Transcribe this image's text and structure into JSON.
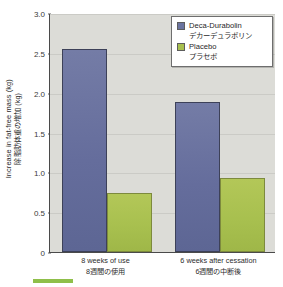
{
  "chart_data": {
    "type": "bar",
    "title": "",
    "subtitle": "",
    "xlabel": "",
    "ylabel": "Increase in fat-free mass (kg)",
    "ylabel_jp": "除脂肪体重の増加 (kg)",
    "ylim": [
      0,
      3.0
    ],
    "ytick_labels": [
      "0",
      "0.5",
      "1.0",
      "1.5",
      "2.0",
      "2.5",
      "3.0"
    ],
    "ytick_values": [
      0,
      0.5,
      1.0,
      1.5,
      2.0,
      2.5,
      3.0
    ],
    "grid": true,
    "legend_position": "top-right",
    "categories": [
      "8 weeks of use",
      "6 weeks after cessation"
    ],
    "categories_jp": [
      "8週間の使用",
      "6週間の中断後"
    ],
    "series": [
      {
        "name": "Deca-Durabolin",
        "name_jp": "デカーデュラボリン",
        "color": "#6b74a0",
        "values": [
          2.55,
          1.88
        ]
      },
      {
        "name": "Placebo",
        "name_jp": "プラセボ",
        "color": "#a8c04f",
        "values": [
          0.74,
          0.93
        ]
      }
    ]
  },
  "colors": {
    "plot_background": "#dcdcd7",
    "page_background": "#ffffff",
    "axis": "#4a4a4a",
    "gridline": "#cbcbc6",
    "accent_bar": "#8fbf4a"
  }
}
